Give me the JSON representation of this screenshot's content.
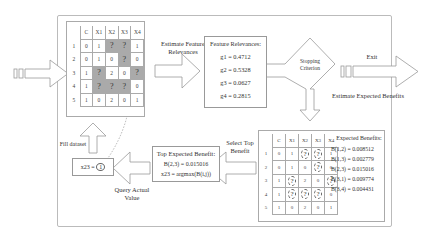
{
  "diagram": {
    "labels": {
      "estimate_relevances": "Estimate Feature Relevances",
      "stopping_criterion": "Stopping Criterion",
      "exit": "Exit",
      "estimate_benefits": "Estimate Expected Benefits",
      "select_top": "Select Top Benefit",
      "query_actual": "Query Actual Value",
      "fill_dataset": "Fill dataset"
    },
    "dataset_table": {
      "columns": [
        "C",
        "X1",
        "X2",
        "X3",
        "X4"
      ],
      "rows": [
        {
          "id": "1",
          "cells": [
            "0",
            "1",
            "?",
            "?",
            "1"
          ]
        },
        {
          "id": "2",
          "cells": [
            "0",
            "1",
            "0",
            "?",
            "0"
          ]
        },
        {
          "id": "3",
          "cells": [
            "1",
            "?",
            "2",
            "0",
            "?"
          ]
        },
        {
          "id": "4",
          "cells": [
            "1",
            "?",
            "?",
            "?",
            "0"
          ]
        },
        {
          "id": "5",
          "cells": [
            "1",
            "0",
            "2",
            "0",
            "1"
          ]
        }
      ]
    },
    "feature_relevances": {
      "title": "Feature Relevances:",
      "items": [
        "g1 = 0.4712",
        "g2 = 0.5328",
        "g3 = 0.0627",
        "g4 = 0.2815"
      ]
    },
    "expected_benefits": {
      "title": "Expected Benefits:",
      "items": [
        "B(1,2) = 0.008512",
        "B(1,3) = 0.002779",
        "B(2,3) = 0.015016",
        "B(3,1) = 0.009774",
        "B(3,4) = 0.004431"
      ]
    },
    "top_benefit": {
      "title": "Top Expected Benefit:",
      "value": "B(2,3) = 0.015016",
      "formula": "x23 = argmax(B(i,j))"
    },
    "queried_value": {
      "text": "x23 = ",
      "value": "1"
    }
  }
}
